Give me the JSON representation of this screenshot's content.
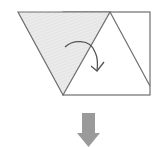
{
  "diagram": {
    "title": "",
    "colors": {
      "line": "#6e6e6e",
      "shade_fill": "#e4e4e4",
      "shade_hatch": "#f2f2f2",
      "arrow": "#9a9a9a",
      "background": "#ffffff"
    },
    "elements": [
      {
        "name": "shaded-flap",
        "type": "triangle",
        "points": [
          [
            18,
            12
          ],
          [
            110,
            12
          ],
          [
            63,
            95
          ]
        ]
      },
      {
        "name": "paper-rectangle",
        "type": "rect",
        "x": 63,
        "y": 12,
        "w": 87,
        "h": 83
      },
      {
        "name": "diagonal-crease",
        "type": "line",
        "from": [
          110,
          12
        ],
        "to": [
          150,
          86
        ]
      },
      {
        "name": "fold-arrow",
        "type": "curved-arrow",
        "start": [
          65,
          47
        ],
        "end": [
          98,
          71
        ]
      },
      {
        "name": "next-step-arrow",
        "type": "down-arrow",
        "x": 89,
        "y": 113
      }
    ]
  }
}
